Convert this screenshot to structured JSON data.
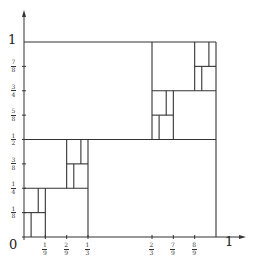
{
  "axes": {
    "origin_label": "0",
    "x_end_label": "1",
    "y_end_label": "1",
    "x_ticks": [
      {
        "num": "1",
        "den": "9",
        "x": 0.1111
      },
      {
        "num": "2",
        "den": "9",
        "x": 0.2222
      },
      {
        "num": "1",
        "den": "3",
        "x": 0.3333
      },
      {
        "num": "2",
        "den": "3",
        "x": 0.6667
      },
      {
        "num": "7",
        "den": "9",
        "x": 0.7778
      },
      {
        "num": "8",
        "den": "9",
        "x": 0.8889
      }
    ],
    "y_ticks": [
      {
        "num": "7",
        "den": "8",
        "y": 0.875
      },
      {
        "num": "3",
        "den": "4",
        "y": 0.75
      },
      {
        "num": "5",
        "den": "8",
        "y": 0.625
      },
      {
        "num": "1",
        "den": "2",
        "y": 0.5
      },
      {
        "num": "3",
        "den": "8",
        "y": 0.375
      },
      {
        "num": "1",
        "den": "4",
        "y": 0.25
      },
      {
        "num": "1",
        "den": "8",
        "y": 0.125
      }
    ]
  },
  "colors": {
    "line": "#333333",
    "background": "#ffffff"
  },
  "segments": [
    {
      "x1": 0,
      "y1": 1,
      "x2": 1,
      "y2": 1
    },
    {
      "x1": 1,
      "y1": 0,
      "x2": 1,
      "y2": 1
    },
    {
      "x1": 0,
      "y1": 0.5,
      "x2": 1,
      "y2": 0.5
    },
    {
      "x1": 0.3333,
      "y1": 0,
      "x2": 0.3333,
      "y2": 0.5
    },
    {
      "x1": 0.6667,
      "y1": 0.5,
      "x2": 0.6667,
      "y2": 1
    },
    {
      "x1": 0,
      "y1": 0.25,
      "x2": 0.3333,
      "y2": 0.25
    },
    {
      "x1": 0.1111,
      "y1": 0,
      "x2": 0.1111,
      "y2": 0.25
    },
    {
      "x1": 0,
      "y1": 0.125,
      "x2": 0.1111,
      "y2": 0.125
    },
    {
      "x1": 0.037,
      "y1": 0,
      "x2": 0.037,
      "y2": 0.125
    },
    {
      "x1": 0.0741,
      "y1": 0.125,
      "x2": 0.0741,
      "y2": 0.25
    },
    {
      "x1": 0.2222,
      "y1": 0.25,
      "x2": 0.2222,
      "y2": 0.5
    },
    {
      "x1": 0.2222,
      "y1": 0.375,
      "x2": 0.3333,
      "y2": 0.375
    },
    {
      "x1": 0.2593,
      "y1": 0.25,
      "x2": 0.2593,
      "y2": 0.375
    },
    {
      "x1": 0.2963,
      "y1": 0.375,
      "x2": 0.2963,
      "y2": 0.5
    },
    {
      "x1": 0.6667,
      "y1": 0.75,
      "x2": 1,
      "y2": 0.75
    },
    {
      "x1": 0.7778,
      "y1": 0.5,
      "x2": 0.7778,
      "y2": 0.75
    },
    {
      "x1": 0.6667,
      "y1": 0.625,
      "x2": 0.7778,
      "y2": 0.625
    },
    {
      "x1": 0.7037,
      "y1": 0.5,
      "x2": 0.7037,
      "y2": 0.625
    },
    {
      "x1": 0.7407,
      "y1": 0.625,
      "x2": 0.7407,
      "y2": 0.75
    },
    {
      "x1": 0.8889,
      "y1": 0.75,
      "x2": 0.8889,
      "y2": 1
    },
    {
      "x1": 0.8889,
      "y1": 0.875,
      "x2": 1,
      "y2": 0.875
    },
    {
      "x1": 0.9259,
      "y1": 0.75,
      "x2": 0.9259,
      "y2": 0.875
    },
    {
      "x1": 0.963,
      "y1": 0.875,
      "x2": 0.963,
      "y2": 1
    }
  ]
}
